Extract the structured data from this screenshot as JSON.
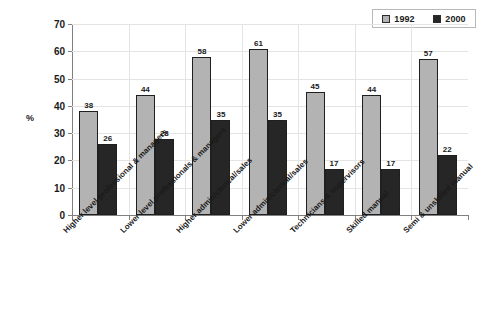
{
  "chart_data": {
    "type": "bar",
    "title": "",
    "xlabel": "",
    "ylabel": "%",
    "ylim": [
      0,
      70
    ],
    "yticks": [
      0,
      10,
      20,
      30,
      40,
      50,
      60,
      70
    ],
    "grid": true,
    "legend_position": "top-right",
    "categories": [
      "Higher level professional & managers",
      "Lower level professionals & managers",
      "Higher admin/clerical/sales",
      "Lower admin/clerical/sales",
      "Technicians & supervisors",
      "Skilled manual",
      "Semi & unskilled manual"
    ],
    "series": [
      {
        "name": "1992",
        "color": "#b3b3b3",
        "values": [
          38,
          44,
          58,
          61,
          45,
          44,
          57
        ]
      },
      {
        "name": "2000",
        "color": "#262626",
        "values": [
          26,
          28,
          35,
          35,
          17,
          17,
          22
        ]
      }
    ]
  },
  "legend": {
    "entries": [
      {
        "label": "1992"
      },
      {
        "label": "2000"
      }
    ]
  },
  "axis": {
    "y_title": "%"
  }
}
